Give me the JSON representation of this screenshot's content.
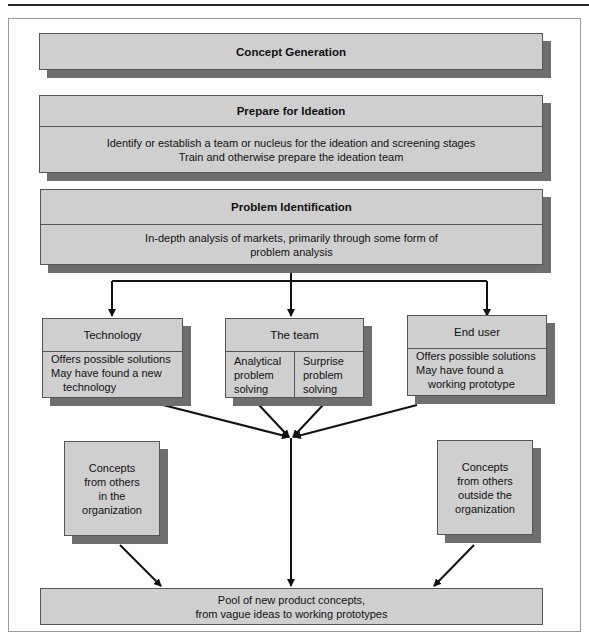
{
  "diagram": {
    "concept_generation": {
      "title": "Concept Generation"
    },
    "prepare": {
      "title": "Prepare for Ideation",
      "lines": [
        "Identify or establish a team or nucleus for the ideation and screening stages",
        "Train and otherwise prepare the ideation team"
      ]
    },
    "problem": {
      "title": "Problem Identification",
      "lines": [
        "In-depth analysis of markets, primarily through some form of",
        "problem analysis"
      ]
    },
    "technology": {
      "title": "Technology",
      "lines": [
        "Offers possible solutions",
        "May have found a new",
        "technology"
      ]
    },
    "team": {
      "title": "The team",
      "left": [
        "Analytical",
        "problem",
        "solving"
      ],
      "right": [
        "Surprise",
        "problem",
        "solving"
      ]
    },
    "end_user": {
      "title": "End user",
      "lines": [
        "Offers possible solutions",
        "May have found a",
        "working prototype"
      ]
    },
    "inside": {
      "lines": [
        "Concepts",
        "from others",
        "in the",
        "organization"
      ]
    },
    "outside": {
      "lines": [
        "Concepts",
        "from others",
        "outside the",
        "organization"
      ]
    },
    "pool": {
      "lines": [
        "Pool of new product concepts,",
        "from vague ideas to working prototypes"
      ]
    },
    "colors": {
      "box_fill": "#cfcfcf",
      "shadow": "#6e6e6e",
      "border": "#555555",
      "arrow": "#111111"
    }
  }
}
